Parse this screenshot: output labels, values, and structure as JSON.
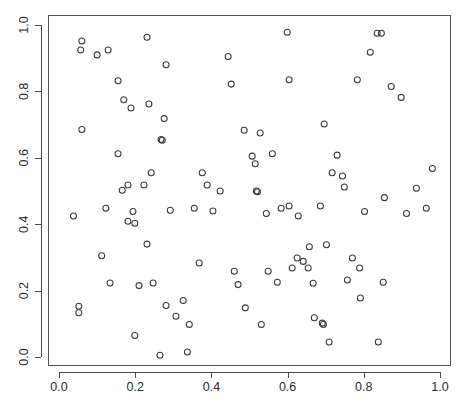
{
  "chart_data": {
    "type": "scatter",
    "title": "",
    "subtitle": "",
    "xlabel": "",
    "ylabel": "",
    "xlim": [
      0.0,
      1.0
    ],
    "ylim": [
      0.0,
      1.0
    ],
    "grid": false,
    "legend": null,
    "marker": {
      "shape": "open-circle",
      "radius_px": 3,
      "stroke_color": "#3c3c3c",
      "fill": "none"
    },
    "axis_color": "#4a4a4a",
    "background_color": "#ffffff",
    "xticks": [
      0.0,
      0.2,
      0.4,
      0.6,
      0.8,
      1.0
    ],
    "xtick_labels": [
      "0.0",
      "0.2",
      "0.4",
      "0.6",
      "0.8",
      "1.0"
    ],
    "yticks": [
      0.0,
      0.2,
      0.4,
      0.6,
      0.8,
      1.0
    ],
    "ytick_labels": [
      "0.0",
      "0.2",
      "0.4",
      "0.6",
      "0.8",
      "1.0"
    ],
    "ytick_label_rotation": -90,
    "n_points": 100,
    "points": [
      [
        0.06,
        0.685
      ],
      [
        0.038,
        0.425
      ],
      [
        0.052,
        0.153
      ],
      [
        0.052,
        0.133
      ],
      [
        0.06,
        0.952
      ],
      [
        0.057,
        0.925
      ],
      [
        0.1,
        0.91
      ],
      [
        0.129,
        0.925
      ],
      [
        0.155,
        0.612
      ],
      [
        0.123,
        0.448
      ],
      [
        0.112,
        0.305
      ],
      [
        0.21,
        0.215
      ],
      [
        0.134,
        0.223
      ],
      [
        0.155,
        0.832
      ],
      [
        0.17,
        0.775
      ],
      [
        0.189,
        0.75
      ],
      [
        0.181,
        0.518
      ],
      [
        0.166,
        0.502
      ],
      [
        0.194,
        0.438
      ],
      [
        0.181,
        0.409
      ],
      [
        0.199,
        0.403
      ],
      [
        0.231,
        0.963
      ],
      [
        0.236,
        0.762
      ],
      [
        0.242,
        0.555
      ],
      [
        0.223,
        0.518
      ],
      [
        0.231,
        0.34
      ],
      [
        0.199,
        0.065
      ],
      [
        0.247,
        0.223
      ],
      [
        0.265,
        0.005
      ],
      [
        0.281,
        0.88
      ],
      [
        0.276,
        0.718
      ],
      [
        0.268,
        0.655
      ],
      [
        0.271,
        0.653
      ],
      [
        0.292,
        0.442
      ],
      [
        0.281,
        0.155
      ],
      [
        0.307,
        0.123
      ],
      [
        0.326,
        0.17
      ],
      [
        0.337,
        0.015
      ],
      [
        0.342,
        0.098
      ],
      [
        0.355,
        0.448
      ],
      [
        0.376,
        0.555
      ],
      [
        0.389,
        0.518
      ],
      [
        0.368,
        0.283
      ],
      [
        0.404,
        0.44
      ],
      [
        0.423,
        0.5
      ],
      [
        0.444,
        0.905
      ],
      [
        0.452,
        0.822
      ],
      [
        0.46,
        0.258
      ],
      [
        0.47,
        0.218
      ],
      [
        0.486,
        0.683
      ],
      [
        0.489,
        0.148
      ],
      [
        0.507,
        0.605
      ],
      [
        0.515,
        0.582
      ],
      [
        0.518,
        0.5
      ],
      [
        0.521,
        0.498
      ],
      [
        0.528,
        0.675
      ],
      [
        0.531,
        0.098
      ],
      [
        0.544,
        0.432
      ],
      [
        0.549,
        0.258
      ],
      [
        0.56,
        0.612
      ],
      [
        0.573,
        0.225
      ],
      [
        0.583,
        0.448
      ],
      [
        0.599,
        0.978
      ],
      [
        0.604,
        0.835
      ],
      [
        0.604,
        0.455
      ],
      [
        0.612,
        0.268
      ],
      [
        0.625,
        0.298
      ],
      [
        0.628,
        0.425
      ],
      [
        0.641,
        0.288
      ],
      [
        0.654,
        0.268
      ],
      [
        0.657,
        0.332
      ],
      [
        0.667,
        0.222
      ],
      [
        0.67,
        0.118
      ],
      [
        0.686,
        0.455
      ],
      [
        0.691,
        0.102
      ],
      [
        0.694,
        0.098
      ],
      [
        0.696,
        0.702
      ],
      [
        0.702,
        0.338
      ],
      [
        0.709,
        0.045
      ],
      [
        0.717,
        0.555
      ],
      [
        0.73,
        0.608
      ],
      [
        0.744,
        0.545
      ],
      [
        0.749,
        0.512
      ],
      [
        0.757,
        0.232
      ],
      [
        0.77,
        0.298
      ],
      [
        0.783,
        0.835
      ],
      [
        0.789,
        0.268
      ],
      [
        0.791,
        0.178
      ],
      [
        0.802,
        0.438
      ],
      [
        0.817,
        0.918
      ],
      [
        0.835,
        0.975
      ],
      [
        0.846,
        0.975
      ],
      [
        0.838,
        0.045
      ],
      [
        0.851,
        0.225
      ],
      [
        0.854,
        0.48
      ],
      [
        0.872,
        0.815
      ],
      [
        0.898,
        0.782
      ],
      [
        0.912,
        0.432
      ],
      [
        0.938,
        0.508
      ],
      [
        0.964,
        0.448
      ],
      [
        0.98,
        0.568
      ]
    ]
  }
}
